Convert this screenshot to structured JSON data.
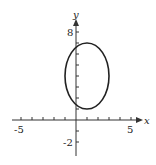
{
  "chart_data": {
    "type": "line",
    "title": "",
    "xlabel": "x",
    "ylabel": "y",
    "xlim": [
      -5.5,
      6
    ],
    "ylim": [
      -2.8,
      9
    ],
    "x_tick_labels": [
      "-5",
      "5"
    ],
    "y_tick_labels": [
      "8",
      "-2"
    ],
    "x_ticks": [
      -5,
      -4,
      -3,
      -2,
      -1,
      1,
      2,
      3,
      4,
      5
    ],
    "y_ticks": [
      -2,
      -1,
      1,
      2,
      3,
      4,
      5,
      6,
      7,
      8
    ],
    "grid": false,
    "curves": [
      {
        "name": "ellipse",
        "shape": "ellipse",
        "center": [
          1,
          4
        ],
        "semi_axis_x": 2,
        "semi_axis_y": 3,
        "color": "#222222"
      }
    ]
  },
  "labels": {
    "x_axis": "x",
    "y_axis": "y",
    "x_min": "-5",
    "x_max": "5",
    "y_max": "8",
    "y_min": "-2"
  }
}
